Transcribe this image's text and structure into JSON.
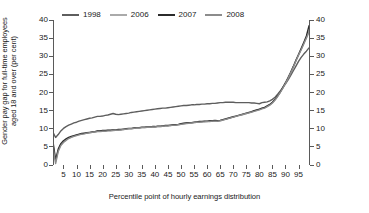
{
  "chart_data": {
    "type": "line",
    "title": "",
    "xlabel": "Percentile point of hourly earnings distribution",
    "ylabel": "Gender pay gap for full-time employees aged 18 and over (per cent)",
    "ylabel_line1": "Gender pay gap for full-time employees",
    "ylabel_line2": "aged 18 and over (per cent)",
    "xlim": [
      1,
      99
    ],
    "ylim": [
      0,
      40
    ],
    "yticks": [
      0,
      5,
      10,
      15,
      20,
      25,
      30,
      35,
      40
    ],
    "xticks": [
      5,
      10,
      15,
      20,
      25,
      30,
      35,
      40,
      45,
      50,
      55,
      60,
      65,
      70,
      75,
      80,
      85,
      90,
      95
    ],
    "grid": false,
    "legend_position": "top",
    "dual_y_axis": true,
    "x": [
      1,
      2,
      3,
      4,
      5,
      6,
      7,
      8,
      9,
      10,
      11,
      12,
      13,
      14,
      15,
      16,
      17,
      18,
      19,
      20,
      21,
      22,
      23,
      24,
      25,
      26,
      27,
      28,
      29,
      30,
      31,
      32,
      33,
      34,
      35,
      36,
      37,
      38,
      39,
      40,
      41,
      42,
      43,
      44,
      45,
      46,
      47,
      48,
      49,
      50,
      51,
      52,
      53,
      54,
      55,
      56,
      57,
      58,
      59,
      60,
      61,
      62,
      63,
      64,
      65,
      66,
      67,
      68,
      69,
      70,
      71,
      72,
      73,
      74,
      75,
      76,
      77,
      78,
      79,
      80,
      81,
      82,
      83,
      84,
      85,
      86,
      87,
      88,
      89,
      90,
      91,
      92,
      93,
      94,
      95,
      96,
      97,
      98,
      99
    ],
    "series": [
      {
        "name": "1998",
        "color": "#5e5e5e",
        "values": [
          9.0,
          7.6,
          8.4,
          9.4,
          10.1,
          10.6,
          11.0,
          11.3,
          11.6,
          11.8,
          12.1,
          12.3,
          12.5,
          12.7,
          12.9,
          13.0,
          13.2,
          13.4,
          13.4,
          13.5,
          13.7,
          13.8,
          14.0,
          14.2,
          14.0,
          13.9,
          14.0,
          14.1,
          14.2,
          14.3,
          14.5,
          14.6,
          14.7,
          14.8,
          14.9,
          15.0,
          15.1,
          15.2,
          15.3,
          15.4,
          15.5,
          15.6,
          15.7,
          15.7,
          15.8,
          15.9,
          16.0,
          16.1,
          16.2,
          16.3,
          16.4,
          16.4,
          16.5,
          16.6,
          16.6,
          16.7,
          16.7,
          16.8,
          16.8,
          16.9,
          16.9,
          17.0,
          17.0,
          17.1,
          17.2,
          17.2,
          17.3,
          17.3,
          17.3,
          17.3,
          17.2,
          17.2,
          17.2,
          17.2,
          17.2,
          17.2,
          17.1,
          17.1,
          17.0,
          16.9,
          17.2,
          17.3,
          17.4,
          17.7,
          18.1,
          18.7,
          19.5,
          20.4,
          21.4,
          22.4,
          23.5,
          24.7,
          26.0,
          27.3,
          28.6,
          29.7,
          30.6,
          31.4,
          32.3
        ]
      },
      {
        "name": "2006",
        "color": "#aaaaaa",
        "values": [
          5.8,
          0.9,
          4.0,
          5.6,
          6.4,
          7.0,
          7.4,
          7.7,
          8.0,
          8.2,
          8.4,
          8.6,
          8.7,
          8.8,
          8.9,
          9.0,
          9.1,
          9.3,
          9.3,
          9.4,
          9.4,
          9.5,
          9.5,
          9.6,
          9.6,
          9.7,
          9.7,
          9.8,
          9.9,
          10.0,
          10.0,
          10.1,
          10.2,
          10.2,
          10.3,
          10.3,
          10.4,
          10.4,
          10.5,
          10.5,
          10.6,
          10.6,
          10.7,
          10.8,
          10.8,
          10.9,
          11.0,
          11.0,
          11.1,
          11.3,
          11.4,
          11.5,
          11.6,
          11.6,
          11.7,
          11.8,
          11.9,
          11.9,
          12.0,
          12.0,
          12.1,
          12.1,
          12.2,
          12.1,
          12.2,
          12.4,
          12.6,
          12.8,
          13.0,
          13.2,
          13.4,
          13.6,
          13.8,
          14.0,
          14.2,
          14.4,
          14.6,
          14.9,
          15.1,
          15.3,
          15.6,
          15.8,
          16.2,
          16.6,
          17.2,
          18.0,
          19.0,
          20.1,
          21.3,
          22.6,
          24.0,
          25.5,
          27.1,
          28.8,
          30.4,
          31.9,
          33.5,
          35.2,
          37.1
        ]
      },
      {
        "name": "2007",
        "color": "#2b2b2b",
        "values": [
          6.4,
          1.4,
          4.4,
          5.9,
          6.7,
          7.2,
          7.6,
          7.9,
          8.1,
          8.3,
          8.5,
          8.7,
          8.8,
          8.9,
          9.0,
          9.1,
          9.2,
          9.4,
          9.4,
          9.5,
          9.5,
          9.6,
          9.6,
          9.7,
          9.7,
          9.8,
          9.8,
          9.9,
          10.0,
          10.1,
          10.1,
          10.2,
          10.3,
          10.3,
          10.4,
          10.4,
          10.5,
          10.5,
          10.6,
          10.6,
          10.7,
          10.7,
          10.8,
          10.9,
          10.9,
          11.0,
          11.1,
          11.1,
          11.2,
          11.4,
          11.5,
          11.6,
          11.7,
          11.7,
          11.8,
          11.9,
          12.0,
          12.0,
          12.1,
          12.1,
          12.2,
          12.2,
          12.3,
          12.2,
          12.3,
          12.5,
          12.7,
          12.9,
          13.1,
          13.3,
          13.5,
          13.7,
          13.9,
          14.1,
          14.3,
          14.5,
          14.7,
          15.0,
          15.2,
          15.4,
          15.7,
          15.9,
          16.3,
          16.7,
          17.3,
          18.1,
          19.1,
          20.2,
          21.4,
          22.7,
          24.1,
          25.6,
          27.2,
          28.9,
          30.5,
          32.1,
          33.8,
          35.6,
          38.4
        ]
      },
      {
        "name": "2008",
        "color": "#8c8c8c",
        "values": [
          5.1,
          0.4,
          3.7,
          5.4,
          6.2,
          6.8,
          7.3,
          7.6,
          7.9,
          8.1,
          8.3,
          8.5,
          8.6,
          8.8,
          8.9,
          9.0,
          9.1,
          9.2,
          9.2,
          9.3,
          9.3,
          9.4,
          9.4,
          9.5,
          9.6,
          9.6,
          9.7,
          9.8,
          9.9,
          10.0,
          10.0,
          10.1,
          10.2,
          10.2,
          10.3,
          10.3,
          10.4,
          10.4,
          10.5,
          10.5,
          10.6,
          10.6,
          10.7,
          10.8,
          10.8,
          10.9,
          11.0,
          11.0,
          11.1,
          11.2,
          11.3,
          11.4,
          11.5,
          11.6,
          11.7,
          11.8,
          11.8,
          11.9,
          11.9,
          12.0,
          12.0,
          12.1,
          12.1,
          12.1,
          12.2,
          12.4,
          12.6,
          12.8,
          13.0,
          13.2,
          13.4,
          13.6,
          13.8,
          14.0,
          14.2,
          14.4,
          14.6,
          14.8,
          15.0,
          15.2,
          15.5,
          15.7,
          16.1,
          16.5,
          17.1,
          17.9,
          18.9,
          20.0,
          21.2,
          22.5,
          23.9,
          25.4,
          27.0,
          28.7,
          30.3,
          31.8,
          33.4,
          35.0,
          36.6
        ]
      }
    ]
  }
}
